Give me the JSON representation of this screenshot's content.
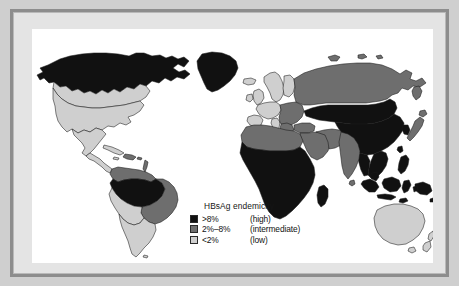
{
  "figure": {
    "frame_color": "#8d8d8d",
    "background_color": "#cfcfcf",
    "map_background": "#ffffff",
    "ocean_color": "#ffffff"
  },
  "legend": {
    "title": "HBsAg endemicity",
    "entries": [
      {
        "range": ">8%",
        "label": "(high)",
        "color": "#111111",
        "level": "high"
      },
      {
        "range": "2%–8%",
        "label": "(intermediate)",
        "color": "#6e6e6e",
        "level": "intermediate"
      },
      {
        "range": "<2%",
        "label": "(low)",
        "color": "#cfcfcf",
        "level": "low"
      }
    ]
  },
  "map_data": {
    "type": "choropleth",
    "projection": "equirectangular",
    "categories": [
      "high",
      "intermediate",
      "low"
    ],
    "category_colors": {
      "high": "#111111",
      "intermediate": "#6e6e6e",
      "low": "#cfcfcf"
    },
    "regions": [
      {
        "name": "Alaska and northern Canada",
        "level": "high"
      },
      {
        "name": "Greenland",
        "level": "high"
      },
      {
        "name": "Canada (southern)",
        "level": "low"
      },
      {
        "name": "United States",
        "level": "low"
      },
      {
        "name": "Mexico",
        "level": "low"
      },
      {
        "name": "Central America",
        "level": "low"
      },
      {
        "name": "Caribbean",
        "level": "low"
      },
      {
        "name": "Haiti and Dominican Republic",
        "level": "intermediate"
      },
      {
        "name": "Colombia and Venezuela",
        "level": "intermediate"
      },
      {
        "name": "Amazon basin",
        "level": "high"
      },
      {
        "name": "Brazil",
        "level": "intermediate"
      },
      {
        "name": "Peru and Bolivia",
        "level": "low"
      },
      {
        "name": "Argentina, Chile, Uruguay",
        "level": "low"
      },
      {
        "name": "Western Europe",
        "level": "low"
      },
      {
        "name": "Scandinavia",
        "level": "low"
      },
      {
        "name": "United Kingdom and Ireland",
        "level": "low"
      },
      {
        "name": "Eastern and southern Europe",
        "level": "intermediate"
      },
      {
        "name": "Russia and Siberia",
        "level": "intermediate"
      },
      {
        "name": "North Africa",
        "level": "intermediate"
      },
      {
        "name": "Sub-Saharan Africa",
        "level": "high"
      },
      {
        "name": "Madagascar",
        "level": "high"
      },
      {
        "name": "Middle East",
        "level": "intermediate"
      },
      {
        "name": "Turkey",
        "level": "intermediate"
      },
      {
        "name": "India",
        "level": "intermediate"
      },
      {
        "name": "Central Asia",
        "level": "high"
      },
      {
        "name": "China",
        "level": "high"
      },
      {
        "name": "Mongolia",
        "level": "high"
      },
      {
        "name": "Korea",
        "level": "high"
      },
      {
        "name": "Japan",
        "level": "intermediate"
      },
      {
        "name": "Southeast Asia",
        "level": "high"
      },
      {
        "name": "Indonesia",
        "level": "high"
      },
      {
        "name": "Philippines",
        "level": "high"
      },
      {
        "name": "Papua New Guinea",
        "level": "high"
      },
      {
        "name": "Pacific Islands",
        "level": "high"
      },
      {
        "name": "Australia",
        "level": "low"
      },
      {
        "name": "New Zealand",
        "level": "low"
      }
    ]
  }
}
